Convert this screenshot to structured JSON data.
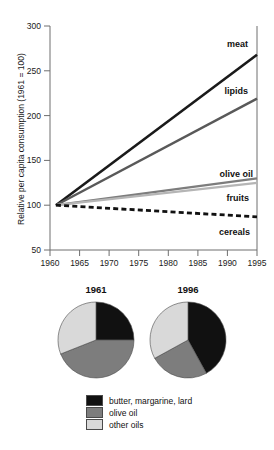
{
  "chart_data": [
    {
      "type": "line",
      "title": "",
      "xlabel": "",
      "ylabel": "Relative per capita consumption (1961 = 100)",
      "xlim": [
        1960,
        1995
      ],
      "ylim": [
        50,
        300
      ],
      "xticks": [
        "1960",
        "1965",
        "1970",
        "1975",
        "1980",
        "1985",
        "1990",
        "1995"
      ],
      "yticks": [
        "50",
        "100",
        "150",
        "200",
        "250",
        "300"
      ],
      "grid": false,
      "legend_position": "inline-right-labels",
      "series": [
        {
          "name": "meat",
          "label": "meat",
          "color": "#1a1a1a",
          "style": "solid",
          "width": 2.6,
          "x": [
            1961,
            1995
          ],
          "values": [
            100,
            268
          ]
        },
        {
          "name": "lipids",
          "label": "lipids",
          "color": "#595959",
          "style": "solid",
          "width": 2.4,
          "x": [
            1961,
            1995
          ],
          "values": [
            100,
            219
          ]
        },
        {
          "name": "olive oil",
          "label": "olive oil",
          "color": "#7d7d7d",
          "style": "solid",
          "width": 2.2,
          "x": [
            1961,
            1995
          ],
          "values": [
            100,
            130
          ]
        },
        {
          "name": "fruits",
          "label": "fruits",
          "color": "#b5b5b5",
          "style": "solid",
          "width": 2.2,
          "x": [
            1961,
            1995
          ],
          "values": [
            100,
            125
          ]
        },
        {
          "name": "cereals",
          "label": "cereals",
          "color": "#111111",
          "style": "dashed",
          "width": 2.8,
          "x": [
            1961,
            1995
          ],
          "values": [
            100,
            87
          ]
        }
      ]
    },
    {
      "type": "pie",
      "title": "1961",
      "labels": [
        "butter, margarine, lard",
        "olive oil",
        "other oils"
      ],
      "values": [
        25,
        44,
        31
      ],
      "colors": [
        "#111111",
        "#7d7d7d",
        "#d9d9d9"
      ],
      "start_angle_deg": 0
    },
    {
      "type": "pie",
      "title": "1996",
      "labels": [
        "butter, margarine, lard",
        "olive oil",
        "other oils"
      ],
      "values": [
        42,
        25,
        33
      ],
      "colors": [
        "#111111",
        "#7d7d7d",
        "#d9d9d9"
      ],
      "start_angle_deg": 0
    }
  ],
  "line_chart": {
    "ylabel": "Relative per capita consumption (1961 = 100)",
    "xticks": [
      "1960",
      "1965",
      "1970",
      "1975",
      "1980",
      "1985",
      "1990",
      "1995"
    ],
    "yticks": [
      "300",
      "250",
      "200",
      "150",
      "100",
      "50"
    ],
    "series_labels": {
      "meat": "meat",
      "lipids": "lipids",
      "olive_oil": "olive oil",
      "fruits": "fruits",
      "cereals": "cereals"
    }
  },
  "pies": {
    "left": {
      "title": "1961"
    },
    "right": {
      "title": "1996"
    }
  },
  "legend": {
    "items": [
      {
        "label": "butter, margarine, lard",
        "color": "#111111"
      },
      {
        "label": "olive oil",
        "color": "#7d7d7d"
      },
      {
        "label": "other oils",
        "color": "#d9d9d9"
      }
    ]
  }
}
